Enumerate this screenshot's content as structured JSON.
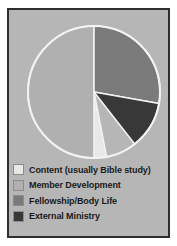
{
  "figure": {
    "background_color": "#b6b6b6",
    "border_color": "#2e2e2e",
    "page_background": "#ffffff"
  },
  "chart_data": {
    "type": "pie",
    "title": "",
    "subtitle": "",
    "xlabel": "",
    "ylabel": "",
    "legend_position": "bottom-left",
    "grid": false,
    "start_angle_deg": 0,
    "direction": "clockwise",
    "separator_color": "#f2f2f2",
    "categories": [
      "Content (usually Bible study)",
      "Member Development",
      "Fellowship/Body Life",
      "External Ministry"
    ],
    "values": [
      10,
      50,
      28,
      12
    ],
    "units": "percent",
    "slices": [
      {
        "label": "Content (usually Bible study)",
        "value": 10,
        "color": "#e8e8e8",
        "start_deg": 169,
        "end_deg": 180
      },
      {
        "label": "Member Development",
        "value": 50,
        "color": "#b0b0b0",
        "start_deg": 180,
        "end_deg": 360
      },
      {
        "label": "Fellowship/Body Life",
        "value": 28,
        "color": "#7a7a7a",
        "start_deg": 0,
        "end_deg": 100
      },
      {
        "label": "External Ministry",
        "value": 12,
        "color": "#383838",
        "start_deg": 100,
        "end_deg": 142
      }
    ]
  },
  "legend": {
    "items": [
      {
        "label": "Content (usually Bible study)",
        "color": "#e8e8e8"
      },
      {
        "label": "Member Development",
        "color": "#b0b0b0"
      },
      {
        "label": "Fellowship/Body Life",
        "color": "#7a7a7a"
      },
      {
        "label": "External Ministry",
        "color": "#383838"
      }
    ]
  }
}
